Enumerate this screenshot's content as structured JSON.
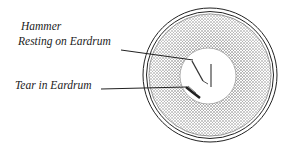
{
  "diagram": {
    "labels": [
      {
        "id": "hammer",
        "line1": "Hammer",
        "line2": "Resting on Eardrum"
      },
      {
        "id": "tear",
        "text": "Tear in Eardrum"
      }
    ],
    "colors": {
      "ink": "#222222",
      "stipple": "#555555",
      "background": "#ffffff"
    }
  }
}
